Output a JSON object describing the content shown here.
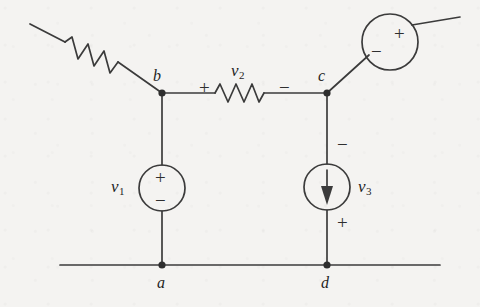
{
  "figure": {
    "type": "electrical-circuit-schematic",
    "background_color": "#f4f3f1",
    "ink_color": "#3b3b3b",
    "width": 480,
    "height": 307
  },
  "nodes": [
    {
      "id": "b",
      "label": "b",
      "x": 162,
      "y": 93
    },
    {
      "id": "c",
      "label": "c",
      "x": 327,
      "y": 93
    },
    {
      "id": "a",
      "label": "a",
      "x": 162,
      "y": 265
    },
    {
      "id": "d",
      "label": "d",
      "x": 327,
      "y": 265
    }
  ],
  "components": {
    "resistor_diagonal": {
      "name": "resistor-diagonal",
      "kind": "resistor",
      "label": "",
      "from": [
        30,
        24
      ],
      "to": [
        162,
        93
      ]
    },
    "resistor_v2": {
      "name": "resistor-v2",
      "kind": "resistor",
      "label": "v",
      "subscript": "2",
      "plus_sign": "+",
      "minus_sign": "−",
      "between": [
        "b",
        "c"
      ]
    },
    "source_v1": {
      "name": "voltage-source-v1",
      "kind": "voltage-source",
      "label": "v",
      "subscript": "1",
      "top_sign": "+",
      "bottom_sign": "−",
      "center": [
        162,
        188
      ],
      "radius": 23,
      "between": [
        "b",
        "a"
      ]
    },
    "source_v3": {
      "name": "current-source-v3",
      "kind": "current-source",
      "label": "v",
      "subscript": "3",
      "top_sign": "−",
      "bottom_sign": "+",
      "arrow_direction": "down",
      "center": [
        327,
        187
      ],
      "radius": 23,
      "between": [
        "c",
        "d"
      ]
    },
    "source_top_right": {
      "name": "voltage-source-top-right",
      "kind": "voltage-source",
      "label": "",
      "left_sign": "−",
      "right_sign": "+",
      "center": [
        390,
        42
      ],
      "radius": 28
    }
  },
  "rails": {
    "bottom_rail": {
      "name": "bottom-ground-rail",
      "from": [
        60,
        265
      ],
      "to": [
        440,
        265
      ]
    }
  }
}
